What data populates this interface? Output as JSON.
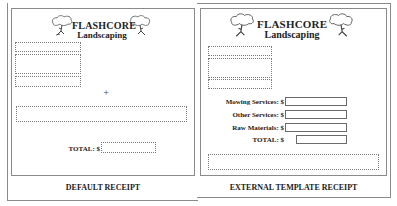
{
  "left_receipt": {
    "brand_line1": "FLASHCORE",
    "brand_line2": "Landscaping",
    "plus_symbol": "+",
    "total_label": "TOTAL:  $",
    "total_value": "",
    "caption": "DEFAULT RECEIPT",
    "icons": [
      "tree-icon",
      "tree-icon"
    ]
  },
  "right_receipt": {
    "brand_line1": "FLASHCORE",
    "brand_line2": "Landscaping",
    "fields": [
      {
        "label": "Mowing Services:  $",
        "value": ""
      },
      {
        "label": "Other Services:  $",
        "value": ""
      },
      {
        "label": "Raw Materials:  $",
        "value": ""
      },
      {
        "label": "TOTAL:   $",
        "value": ""
      }
    ],
    "caption": "EXTERNAL TEMPLATE RECEIPT",
    "icons": [
      "tree-icon",
      "tree-icon"
    ]
  },
  "colors": {
    "frame": "#8a8a8a",
    "text": "#222222",
    "background": "#ffffff"
  }
}
